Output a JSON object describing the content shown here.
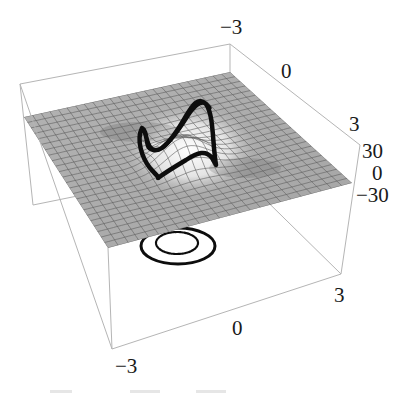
{
  "chart_data": {
    "type": "surface3d",
    "title": "",
    "x_axis": {
      "range": [
        -3,
        3
      ],
      "ticks": [
        "-3",
        "0",
        "3"
      ],
      "label": ""
    },
    "y_axis": {
      "range": [
        -3,
        3
      ],
      "ticks": [
        "-3",
        "0",
        "3"
      ],
      "label": ""
    },
    "z_axis": {
      "range": [
        -30,
        30
      ],
      "ticks": [
        "30",
        "0",
        "-30"
      ],
      "label": ""
    },
    "grid": "mesh on surface",
    "legend": null,
    "annotations": [
      "S-shaped contour on surface",
      "two concentric rings on floor"
    ],
    "colors": {
      "surface": "#a9a9a9",
      "mesh": "#5e5e5e",
      "contour": "#0d0d0d",
      "box": "#b5b5b5"
    }
  },
  "labels": {
    "top_y_min": "−3",
    "top_y_mid": "0",
    "top_y_max": "3",
    "z_top": "30",
    "z_mid": "0",
    "z_bottom": "−30",
    "bottom_x_max": "3",
    "bottom_x_mid": "0",
    "bottom_x_min": "−3"
  }
}
